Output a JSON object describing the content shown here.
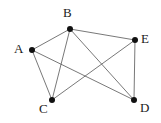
{
  "figure": {
    "kind": "undirected-graph-diagram",
    "background_color": "#ffffff",
    "edge_color": "#555555",
    "vertex_color": "#111111",
    "label_color": "#1a1a1a",
    "width": 161,
    "height": 123
  },
  "graph": {
    "vertices": [
      {
        "id": "A",
        "label": "A",
        "x": 32,
        "y": 50,
        "label_x": 14,
        "label_y": 42
      },
      {
        "id": "B",
        "label": "B",
        "x": 70,
        "y": 29,
        "label_x": 63,
        "label_y": 6
      },
      {
        "id": "C",
        "label": "C",
        "x": 52,
        "y": 100,
        "label_x": 39,
        "label_y": 102
      },
      {
        "id": "D",
        "label": "D",
        "x": 134,
        "y": 100,
        "label_x": 140,
        "label_y": 101
      },
      {
        "id": "E",
        "label": "E",
        "x": 135,
        "y": 40,
        "label_x": 141,
        "label_y": 32
      }
    ],
    "edges": [
      {
        "from": "A",
        "to": "B"
      },
      {
        "from": "A",
        "to": "C"
      },
      {
        "from": "A",
        "to": "D"
      },
      {
        "from": "B",
        "to": "C"
      },
      {
        "from": "B",
        "to": "D"
      },
      {
        "from": "B",
        "to": "E"
      },
      {
        "from": "C",
        "to": "E"
      },
      {
        "from": "E",
        "to": "D"
      }
    ],
    "vertex_radius": 3,
    "edge_width": 0.8
  }
}
